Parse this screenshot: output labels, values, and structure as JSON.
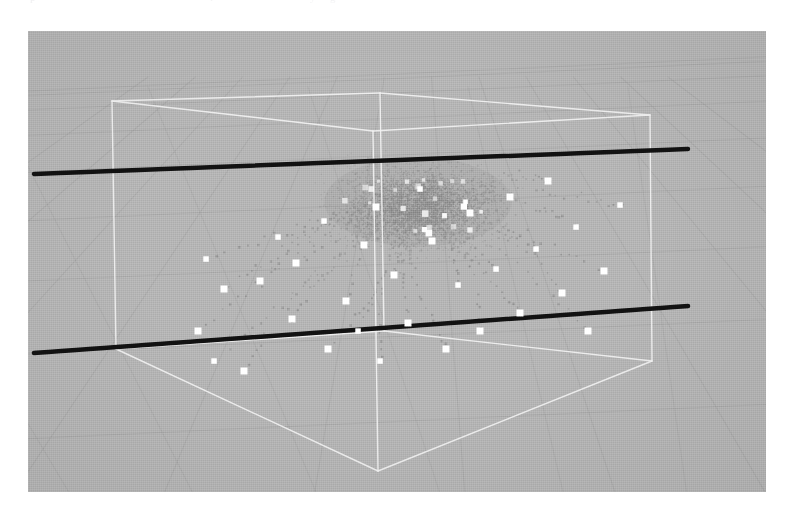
{
  "page": {
    "background_color": "#ffffff",
    "clipped_header_fragments": [
      {
        "text": "p",
        "x": 30,
        "opacity": 0.3
      },
      {
        "text": "i",
        "x": 210,
        "opacity": 0.22
      },
      {
        "text": "y",
        "x": 310,
        "opacity": 0.2
      },
      {
        "text": "g",
        "x": 330,
        "opacity": 0.22
      }
    ]
  },
  "figure": {
    "name": "3d-scatter-plot",
    "x": 28,
    "y": 31,
    "width": 738,
    "height": 461,
    "background_color": "#b4b4b4",
    "colors": {
      "plot_background": "#b4b4b4",
      "ground_grid": "#a2a2a2",
      "bounding_box": "#f2f2f2",
      "axis_lines": "#111111",
      "point_cloud": "#8d8d8d",
      "markers": "#ffffff"
    }
  },
  "chart_data": {
    "type": "scatter",
    "title": "",
    "xlabel": "",
    "ylabel": "",
    "zlabel": "",
    "projection": "3d-perspective",
    "grid": true,
    "legend": null,
    "axis_ranges": {
      "x": [
        0,
        1
      ],
      "y": [
        0,
        1
      ],
      "z": [
        0,
        1
      ]
    },
    "elements": {
      "ground_plane_grid": {
        "description": "perspective floor grid spanning full frame",
        "line_color": "#a2a2a2",
        "u_lines": 9,
        "v_lines": 11
      },
      "bounding_box": {
        "description": "white wireframe cuboid enclosing the point cloud",
        "stroke": "#f2f2f2",
        "stroke_width": 1.4,
        "vertices_px": {
          "top_back_left": [
            84,
            70
          ],
          "top_back_right": [
            352,
            62
          ],
          "top_front_right": [
            622,
            84
          ],
          "top_front_left": [
            345,
            100
          ],
          "bot_back_left": [
            88,
            318
          ],
          "bot_back_right": [
            356,
            300
          ],
          "bot_front_right": [
            624,
            330
          ],
          "bot_front_left": [
            350,
            440
          ]
        }
      },
      "axis_lines": [
        {
          "name": "axis-line-a",
          "from_px": [
            6,
            143
          ],
          "to_px": [
            660,
            118
          ],
          "stroke": "#111111",
          "stroke_width": 4.5
        },
        {
          "name": "axis-line-b",
          "from_px": [
            6,
            322
          ],
          "to_px": [
            660,
            275
          ],
          "stroke": "#111111",
          "stroke_width": 4.5
        }
      ],
      "point_cloud": {
        "description": "dense cluster of small dark-gray dots concentrated near the box center, thinning outward",
        "color": "#8d8d8d",
        "approx_count": 3600,
        "center_px": [
          390,
          175
        ],
        "radius_px": [
          120,
          62
        ]
      },
      "trajectories": {
        "description": "dotted gray trails radiating downward/outward from the cluster, each ending in a white square marker",
        "trail_color": "#8a8a8a",
        "marker_color": "#ffffff",
        "marker_size_px": 7,
        "count": 34,
        "origin_px": [
          392,
          185
        ],
        "endpoints_px": [
          [
            178,
            228
          ],
          [
            196,
            258
          ],
          [
            170,
            300
          ],
          [
            186,
            330
          ],
          [
            216,
            340
          ],
          [
            232,
            250
          ],
          [
            250,
            206
          ],
          [
            268,
            232
          ],
          [
            264,
            288
          ],
          [
            296,
            190
          ],
          [
            300,
            318
          ],
          [
            318,
            270
          ],
          [
            330,
            300
          ],
          [
            336,
            214
          ],
          [
            348,
            176
          ],
          [
            352,
            330
          ],
          [
            366,
            244
          ],
          [
            380,
            292
          ],
          [
            392,
            158
          ],
          [
            404,
            210
          ],
          [
            418,
            318
          ],
          [
            430,
            254
          ],
          [
            442,
            182
          ],
          [
            452,
            300
          ],
          [
            468,
            238
          ],
          [
            482,
            166
          ],
          [
            492,
            282
          ],
          [
            508,
            218
          ],
          [
            520,
            150
          ],
          [
            534,
            262
          ],
          [
            548,
            196
          ],
          [
            560,
            300
          ],
          [
            576,
            240
          ],
          [
            592,
            174
          ]
        ]
      }
    }
  }
}
